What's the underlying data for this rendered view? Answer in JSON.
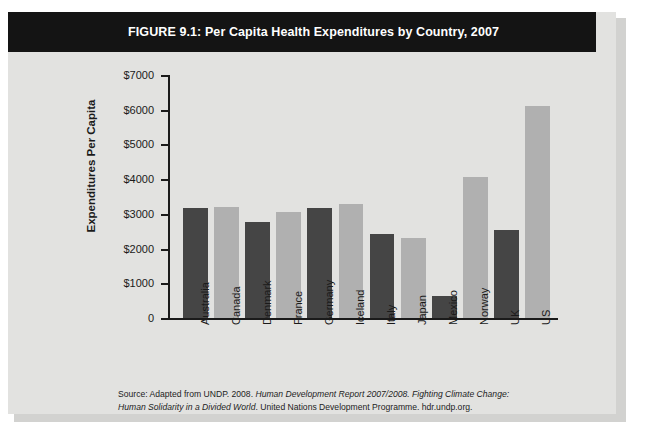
{
  "figure": {
    "label": "FIGURE 9.1:",
    "title": "FIGURE 9.1:  Per Capita Health Expenditures by Country, 2007"
  },
  "source": {
    "line1_a": "Source: Adapted from UNDP. 2008. ",
    "line1_b": "Human Development Report 2007/2008. Fighting Climate Change:",
    "line2_a": "Human Solidarity in a Divided World",
    "line2_b": ". United Nations Development Programme. hdr.undp.org."
  },
  "colors": {
    "banner": "#141414",
    "card_background": "#e2e2e0",
    "bar_dark": "#454545",
    "bar_light": "#b0b0b0",
    "axis": "#1a1a1a"
  },
  "chart_data": {
    "type": "bar",
    "title": "Per Capita Health Expenditures by Country, 2007",
    "xlabel": "",
    "ylabel": "Expenditures Per Capita",
    "ylim": [
      0,
      7000
    ],
    "ytick_labels": [
      "$7000",
      "$6000",
      "$5000",
      "$4000",
      "$3000",
      "$2000",
      "$1000",
      "0"
    ],
    "ytick_values": [
      7000,
      6000,
      5000,
      4000,
      3000,
      2000,
      1000,
      0
    ],
    "grid": false,
    "legend": "none",
    "categories": [
      "Australia",
      "Canada",
      "Denmark",
      "France",
      "Germany",
      "Iceland",
      "Italy",
      "Japan",
      "Mexico",
      "Norway",
      "UK",
      "US"
    ],
    "values": [
      3170,
      3200,
      2780,
      3040,
      3170,
      3290,
      2420,
      2300,
      640,
      4060,
      2530,
      6100
    ],
    "bar_colors": [
      "#454545",
      "#b0b0b0",
      "#454545",
      "#b0b0b0",
      "#454545",
      "#b0b0b0",
      "#454545",
      "#b0b0b0",
      "#454545",
      "#b0b0b0",
      "#454545",
      "#b0b0b0"
    ]
  }
}
